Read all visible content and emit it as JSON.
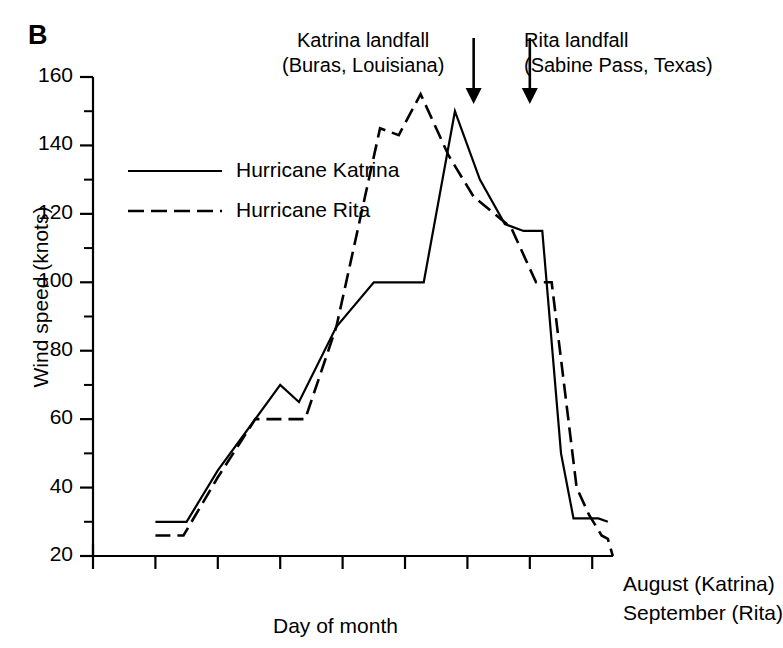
{
  "panel": {
    "label": "B"
  },
  "axes": {
    "ylabel": "Wind speed (knots)",
    "xlabel": "Day of month",
    "yticks": [
      20,
      40,
      60,
      80,
      100,
      120,
      140,
      160
    ],
    "yminor": [
      30,
      50,
      70,
      90,
      110,
      130,
      150
    ],
    "ylim": [
      20,
      160
    ],
    "xlim": [
      23,
      31.333
    ],
    "xticks_major": [
      23,
      25,
      27,
      29,
      31
    ],
    "xticks_minor": [
      24,
      26,
      28,
      30
    ],
    "xticklabels_top": [
      "23",
      "25",
      "27",
      "29",
      "31"
    ],
    "xticklabels_bottom": [
      "17",
      "19",
      "21",
      "23",
      "25"
    ],
    "row_label_top": "August (Katrina)",
    "row_label_bottom": "September (Rita)"
  },
  "legend": {
    "items": [
      {
        "label": "Hurricane Katrina",
        "style": "solid"
      },
      {
        "label": "Hurricane Rita",
        "style": "dashed"
      }
    ]
  },
  "annotations": [
    {
      "name": "katrina-landfall",
      "line1": "Katrina landfall",
      "line2": "(Buras, Louisiana)",
      "arrow_x": 29.1
    },
    {
      "name": "rita-landfall",
      "line1": "Rita landfall",
      "line2": "(Sabine Pass, Texas)",
      "arrow_x": 30.0
    }
  ],
  "chart_data": {
    "type": "line",
    "title": "",
    "xlabel": "Day of month",
    "ylabel": "Wind speed (knots)",
    "xlim": [
      23,
      31.333
    ],
    "ylim": [
      20,
      160
    ],
    "grid": false,
    "legend_position": "upper-left-inside",
    "x_axis_note": "Top tick row = August dates (Katrina); bottom tick row = September dates (Rita); both share the same horizontal positions.",
    "series": [
      {
        "name": "Hurricane Katrina",
        "style": "solid",
        "color": "#000000",
        "points": [
          [
            24.0,
            30
          ],
          [
            24.5,
            30
          ],
          [
            25.0,
            45
          ],
          [
            26.0,
            70
          ],
          [
            26.3,
            65
          ],
          [
            26.9,
            87
          ],
          [
            27.5,
            100
          ],
          [
            28.3,
            100
          ],
          [
            28.8,
            150
          ],
          [
            29.2,
            130
          ],
          [
            29.6,
            117
          ],
          [
            29.9,
            115
          ],
          [
            30.2,
            115
          ],
          [
            30.5,
            50
          ],
          [
            30.7,
            31
          ],
          [
            31.1,
            31
          ],
          [
            31.25,
            30
          ]
        ]
      },
      {
        "name": "Hurricane Rita",
        "style": "dashed",
        "color": "#000000",
        "points": [
          [
            24.0,
            26
          ],
          [
            24.45,
            26
          ],
          [
            25.0,
            43
          ],
          [
            25.6,
            60
          ],
          [
            26.4,
            60
          ],
          [
            26.9,
            87
          ],
          [
            27.6,
            145
          ],
          [
            27.9,
            143
          ],
          [
            28.25,
            155
          ],
          [
            28.7,
            137
          ],
          [
            29.1,
            125
          ],
          [
            29.7,
            116
          ],
          [
            30.1,
            100
          ],
          [
            30.35,
            100
          ],
          [
            30.75,
            40
          ],
          [
            30.95,
            32
          ],
          [
            31.15,
            26
          ],
          [
            31.25,
            25
          ],
          [
            31.33,
            20
          ]
        ]
      }
    ]
  }
}
